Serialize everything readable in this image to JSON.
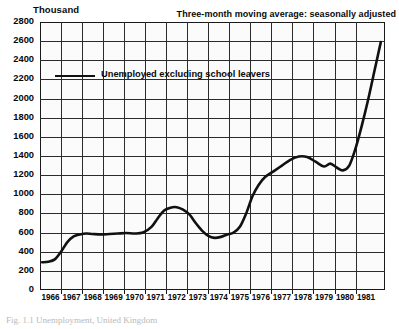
{
  "axis_title": "Thousand",
  "header_note": "Three-month moving average: seasonally adjusted",
  "legend": {
    "label": "Unemployed excluding school leavers",
    "color": "#111111"
  },
  "caption_partial": "Fig. 1.1   Unemployment, United Kingdom",
  "chart_data": {
    "type": "line",
    "title": "",
    "subtitle": "Three-month moving average: seasonally adjusted",
    "xlabel": "",
    "ylabel": "Thousand",
    "ylim": [
      0,
      2800
    ],
    "ytick_step": 200,
    "yticks": [
      0,
      200,
      400,
      600,
      800,
      1000,
      1200,
      1400,
      1600,
      1800,
      2000,
      2200,
      2400,
      2600,
      2800
    ],
    "xticks": [
      "1966",
      "1967",
      "1968",
      "1969",
      "1970",
      "1971",
      "1972",
      "1973",
      "1974",
      "1975",
      "1976",
      "1977",
      "1978",
      "1979",
      "1980",
      "1981"
    ],
    "xlim": [
      1965.5,
      1981.9
    ],
    "grid": true,
    "legend_position": "upper-left-inside",
    "series": [
      {
        "name": "Unemployed excluding school leavers",
        "color": "#111111",
        "x": [
          1965.6,
          1965.9,
          1966.2,
          1966.5,
          1966.8,
          1967.1,
          1967.4,
          1967.7,
          1968.0,
          1968.4,
          1968.8,
          1969.2,
          1969.6,
          1970.0,
          1970.4,
          1970.8,
          1971.1,
          1971.4,
          1971.7,
          1972.0,
          1972.3,
          1972.6,
          1972.9,
          1973.2,
          1973.5,
          1973.8,
          1974.1,
          1974.4,
          1974.7,
          1975.0,
          1975.3,
          1975.6,
          1975.9,
          1976.2,
          1976.6,
          1977.0,
          1977.4,
          1977.8,
          1978.2,
          1978.6,
          1979.0,
          1979.3,
          1979.6,
          1979.9,
          1980.2,
          1980.5,
          1980.8,
          1981.1,
          1981.4,
          1981.7
        ],
        "y": [
          290,
          295,
          320,
          400,
          500,
          560,
          580,
          590,
          585,
          580,
          585,
          590,
          595,
          590,
          600,
          660,
          750,
          830,
          860,
          865,
          840,
          790,
          700,
          620,
          565,
          545,
          555,
          580,
          600,
          660,
          800,
          980,
          1100,
          1180,
          1240,
          1300,
          1360,
          1395,
          1390,
          1340,
          1290,
          1320,
          1280,
          1250,
          1300,
          1480,
          1720,
          1990,
          2290,
          2590
        ]
      }
    ]
  }
}
